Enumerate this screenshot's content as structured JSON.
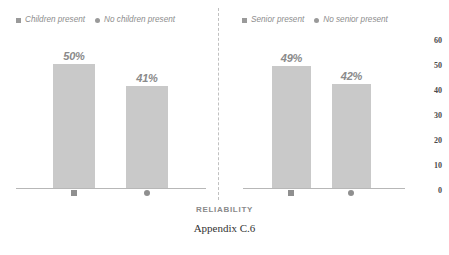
{
  "chart_data": [
    {
      "type": "bar",
      "panel": "left",
      "title": "",
      "categories": [
        "Children present",
        "No children present"
      ],
      "category_markers": [
        "square",
        "circle"
      ],
      "values": [
        50,
        41
      ],
      "data_labels": [
        "50%",
        "41%"
      ],
      "xlabel": "RELIABILITY",
      "ylabel": "",
      "ylim": [
        0,
        60
      ],
      "yticks": [
        60,
        50,
        40,
        30,
        20,
        10,
        0
      ],
      "grid": false,
      "legend_position": "top-left",
      "bar_color": "#c9c9c9"
    },
    {
      "type": "bar",
      "panel": "right",
      "title": "",
      "categories": [
        "Senior present",
        "No senior present"
      ],
      "category_markers": [
        "square",
        "circle"
      ],
      "values": [
        49,
        42
      ],
      "data_labels": [
        "49%",
        "42%"
      ],
      "xlabel": "RELIABILITY",
      "ylabel": "",
      "ylim": [
        0,
        60
      ],
      "yticks": [
        60,
        50,
        40,
        30,
        20,
        10,
        0
      ],
      "grid": false,
      "legend_position": "top-left",
      "bar_color": "#c9c9c9"
    }
  ],
  "legends": {
    "left": [
      {
        "marker": "square-marker",
        "label": "Children present"
      },
      {
        "marker": "circle-marker",
        "label": "No children present"
      }
    ],
    "right": [
      {
        "marker": "square-marker",
        "label": "Senior present"
      },
      {
        "marker": "circle-marker",
        "label": "No senior present"
      }
    ]
  },
  "axis": {
    "ticks": [
      "60",
      "50",
      "40",
      "30",
      "20",
      "10",
      "0"
    ],
    "title": "RELIABILITY"
  },
  "caption": "Appendix C.6",
  "colors": {
    "bar": "#c9c9c9",
    "label": "#8a8a8a",
    "baseline": "#b7b7b7",
    "divider": "#c0c0c0",
    "tick": "#4a4a4a"
  }
}
